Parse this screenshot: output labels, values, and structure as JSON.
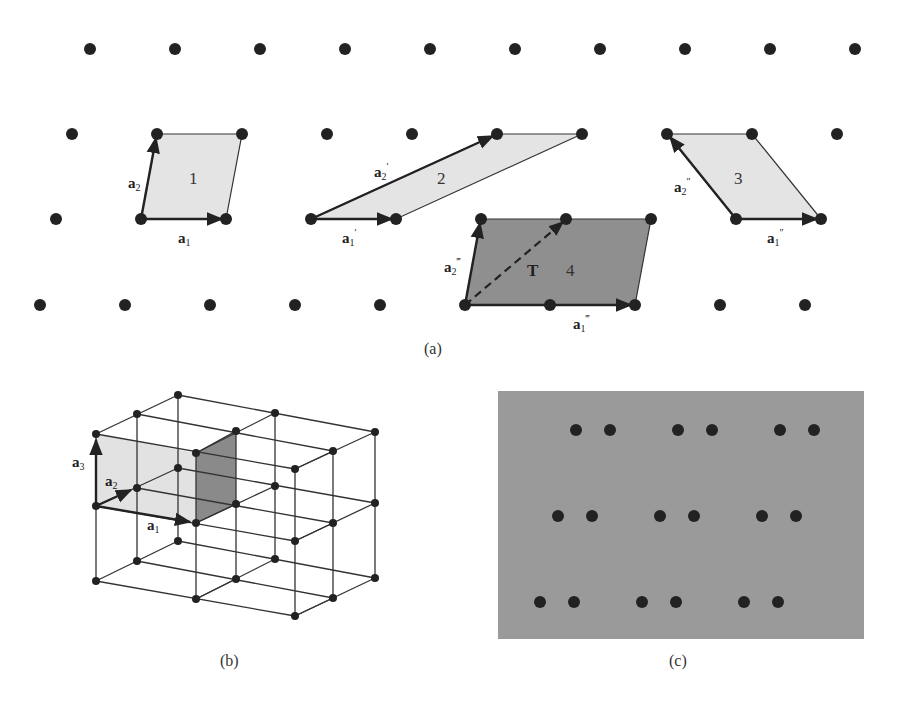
{
  "figure": {
    "panel_a": {
      "caption": "(a)",
      "lattice_rows": [
        {
          "y": 49,
          "x": [
            90,
            175,
            260,
            345,
            430,
            515,
            600,
            685,
            770,
            855
          ]
        },
        {
          "y": 134,
          "x": [
            72,
            157,
            242,
            327,
            412,
            497,
            582,
            667,
            752,
            837
          ]
        },
        {
          "y": 219,
          "x": [
            56,
            141,
            226,
            311,
            396,
            481,
            566,
            651,
            736,
            821
          ]
        },
        {
          "y": 305,
          "x": [
            40,
            125,
            210,
            295,
            380,
            465,
            550,
            635,
            720,
            805
          ]
        }
      ],
      "cells": [
        {
          "id": "1",
          "label": "1",
          "a1": "a",
          "a1_sub": "1",
          "a1_prime": "",
          "a2": "a",
          "a2_sub": "2",
          "a2_prime": "",
          "fill": "#e4e4e4"
        },
        {
          "id": "2",
          "label": "2",
          "a1": "a",
          "a1_sub": "1",
          "a1_prime": "′",
          "a2": "a",
          "a2_sub": "2",
          "a2_prime": "′",
          "fill": "#e4e4e4"
        },
        {
          "id": "3",
          "label": "3",
          "a1": "a",
          "a1_sub": "1",
          "a1_prime": "″",
          "a2": "a",
          "a2_sub": "2",
          "a2_prime": "″",
          "fill": "#e4e4e4"
        },
        {
          "id": "4",
          "label": "4",
          "a1": "a",
          "a1_sub": "1",
          "a1_prime": "‴",
          "a2": "a",
          "a2_sub": "2",
          "a2_prime": "‴",
          "fill": "#8f8f8f",
          "translation_label": "T"
        }
      ]
    },
    "panel_b": {
      "caption": "(b)",
      "vectors": [
        {
          "name": "a",
          "sub": "3"
        },
        {
          "name": "a",
          "sub": "2"
        },
        {
          "name": "a",
          "sub": "1"
        }
      ]
    },
    "panel_c": {
      "caption": "(c)",
      "background": "#9a9a9a",
      "rows": [
        {
          "y": 430,
          "x": [
            576,
            610,
            678,
            712,
            780,
            814
          ]
        },
        {
          "y": 516,
          "x": [
            558,
            592,
            660,
            694,
            762,
            796
          ]
        },
        {
          "y": 602,
          "x": [
            540,
            574,
            642,
            676,
            744,
            778
          ]
        }
      ]
    }
  }
}
